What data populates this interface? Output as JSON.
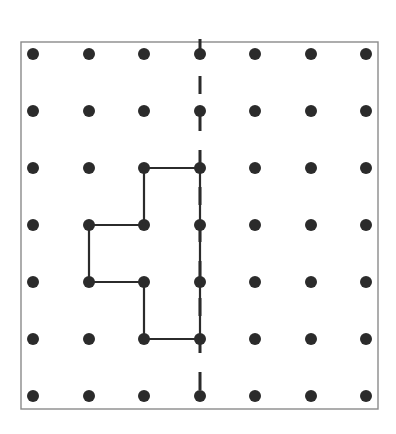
{
  "diagram": {
    "type": "dot-grid-symmetry",
    "grid": {
      "columns": 7,
      "rows": 7,
      "x_positions": [
        33,
        89,
        144,
        200,
        255,
        311,
        366
      ],
      "y_positions": [
        54,
        111,
        168,
        225,
        282,
        339,
        396
      ],
      "dot_radius": 6,
      "dot_color": "#2b2b2b"
    },
    "border": {
      "x": 21,
      "y": 42,
      "width": 357,
      "height": 367,
      "color": "#8a8a8a"
    },
    "shape": {
      "description": "Half of a figure drawn to the left of the line of symmetry",
      "vertices_grid": [
        [
          2,
          2
        ],
        [
          3,
          2
        ],
        [
          3,
          5
        ],
        [
          2,
          5
        ],
        [
          2,
          4
        ],
        [
          1,
          4
        ],
        [
          1,
          3
        ],
        [
          2,
          3
        ]
      ],
      "stroke_color": "#2b2b2b",
      "stroke_width": 2.2
    },
    "symmetry_line": {
      "column": 3,
      "style": "dashed",
      "y_start": 39,
      "y_end": 407,
      "color": "#2b2b2b"
    }
  }
}
